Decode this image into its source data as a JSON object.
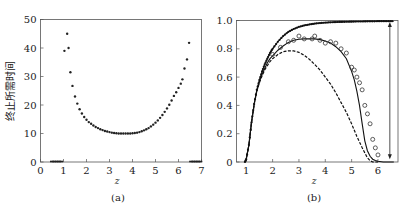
{
  "chart_data": [
    {
      "panel": "(a)",
      "type": "scatter",
      "title": "",
      "xlabel": "z",
      "ylabel": "终止所需时间",
      "xlim": [
        0,
        7
      ],
      "ylim": [
        0,
        50
      ],
      "xticks": [
        "0",
        "1",
        "2",
        "3",
        "4",
        "5",
        "6",
        "7"
      ],
      "yticks": [
        "0",
        "10",
        "20",
        "30",
        "40",
        "50"
      ],
      "grid": false,
      "legend": null,
      "series": [
        {
          "name": "termination time",
          "marker": "dot",
          "x": [
            0.5,
            0.6,
            0.7,
            0.8,
            0.9,
            1.04,
            1.16,
            1.22,
            1.3,
            1.39,
            1.5,
            1.6,
            1.7,
            1.8,
            1.9,
            2.0,
            2.1,
            2.2,
            2.3,
            2.4,
            2.5,
            2.6,
            2.7,
            2.8,
            2.9,
            3.0,
            3.1,
            3.2,
            3.3,
            3.4,
            3.5,
            3.6,
            3.7,
            3.8,
            3.9,
            4.0,
            4.1,
            4.2,
            4.3,
            4.4,
            4.5,
            4.6,
            4.7,
            4.8,
            4.9,
            5.0,
            5.1,
            5.2,
            5.3,
            5.4,
            5.5,
            5.6,
            5.7,
            5.8,
            5.9,
            6.0,
            6.1,
            6.17,
            6.26,
            6.37,
            6.46,
            6.55,
            6.65,
            6.75,
            6.85,
            6.95
          ],
          "y": [
            0,
            0,
            0,
            0,
            0,
            39,
            45,
            40,
            31.5,
            26.7,
            23,
            20.5,
            18.5,
            17,
            15.8,
            14.8,
            14,
            13.4,
            12.8,
            12.3,
            11.9,
            11.5,
            11.2,
            10.9,
            10.7,
            10.5,
            10.3,
            10.2,
            10.1,
            10.0,
            10.0,
            10.0,
            10.0,
            10.0,
            10.0,
            10.1,
            10.2,
            10.3,
            10.5,
            10.8,
            11.1,
            11.5,
            11.9,
            12.5,
            13.1,
            13.8,
            14.6,
            15.5,
            16.5,
            17.6,
            18.8,
            20.1,
            21.6,
            23.2,
            24.5,
            26,
            27.5,
            29,
            32.8,
            36,
            41.8,
            0,
            0,
            0,
            0,
            0
          ]
        }
      ]
    },
    {
      "panel": "(b)",
      "type": "line",
      "title": "",
      "xlabel": "z",
      "ylabel": "",
      "xlim": [
        0.63,
        6.76
      ],
      "ylim": [
        0,
        1.0
      ],
      "xticks": [
        "1",
        "2",
        "3",
        "4",
        "5",
        "6"
      ],
      "yticks": [
        "0",
        "0.2",
        "0.4",
        "0.6",
        "0.8",
        "1.0"
      ],
      "grid": false,
      "legend": null,
      "annotations": [
        {
          "type": "double-arrow",
          "x": 6.45,
          "y_from": 0.02,
          "y_to": 0.99
        }
      ],
      "series": [
        {
          "name": "upper curve (dotted markers)",
          "style": "solid-with-dots",
          "x": [
            0.95,
            1.0,
            1.1,
            1.2,
            1.3,
            1.4,
            1.5,
            1.6,
            1.7,
            1.8,
            1.9,
            2.0,
            2.2,
            2.4,
            2.6,
            2.8,
            3.0,
            3.2,
            3.4,
            3.6,
            3.8,
            4.0,
            4.2,
            4.4,
            4.6,
            4.8,
            5.0,
            5.2,
            5.4,
            5.6,
            5.8,
            6.0,
            6.2,
            6.4,
            6.6
          ],
          "y": [
            0.0,
            0.02,
            0.12,
            0.28,
            0.41,
            0.51,
            0.58,
            0.64,
            0.69,
            0.73,
            0.77,
            0.8,
            0.85,
            0.89,
            0.92,
            0.94,
            0.955,
            0.965,
            0.972,
            0.978,
            0.982,
            0.985,
            0.987,
            0.989,
            0.99,
            0.991,
            0.992,
            0.993,
            0.993,
            0.994,
            0.994,
            0.995,
            0.995,
            0.995,
            0.995
          ]
        },
        {
          "name": "middle solid curve",
          "style": "solid",
          "x": [
            0.95,
            1.0,
            1.1,
            1.2,
            1.3,
            1.4,
            1.5,
            1.6,
            1.7,
            1.8,
            1.9,
            2.0,
            2.2,
            2.4,
            2.6,
            2.8,
            3.0,
            3.2,
            3.4,
            3.6,
            3.8,
            4.0,
            4.2,
            4.4,
            4.6,
            4.8,
            5.0,
            5.1,
            5.2,
            5.3,
            5.4,
            5.5,
            5.6,
            5.7,
            5.8,
            5.9,
            6.0,
            6.2,
            6.4,
            6.6
          ],
          "y": [
            0.0,
            0.02,
            0.12,
            0.28,
            0.41,
            0.5,
            0.57,
            0.62,
            0.66,
            0.7,
            0.73,
            0.75,
            0.79,
            0.82,
            0.845,
            0.86,
            0.867,
            0.87,
            0.87,
            0.87,
            0.865,
            0.855,
            0.84,
            0.815,
            0.78,
            0.73,
            0.64,
            0.58,
            0.5,
            0.4,
            0.27,
            0.15,
            0.08,
            0.04,
            0.02,
            0.01,
            0.005,
            0.0,
            0.0,
            0.0
          ]
        },
        {
          "name": "open circles (simulation)",
          "style": "markers-circle",
          "x": [
            2.0,
            2.3,
            2.6,
            2.8,
            3.0,
            3.2,
            3.5,
            3.6,
            3.8,
            4.0,
            4.2,
            4.4,
            4.6,
            4.8,
            5.0,
            5.1,
            5.2,
            5.3,
            5.4,
            5.5,
            5.6,
            5.7,
            5.8,
            5.9,
            6.0
          ],
          "y": [
            0.76,
            0.81,
            0.85,
            0.86,
            0.89,
            0.87,
            0.87,
            0.89,
            0.86,
            0.84,
            0.85,
            0.84,
            0.8,
            0.77,
            0.67,
            0.65,
            0.6,
            0.56,
            0.51,
            0.4,
            0.34,
            0.27,
            0.16,
            0.1,
            0.05
          ]
        },
        {
          "name": "lower dashed curve",
          "style": "dashed",
          "x": [
            0.95,
            1.0,
            1.1,
            1.2,
            1.3,
            1.4,
            1.5,
            1.6,
            1.7,
            1.8,
            1.9,
            2.0,
            2.2,
            2.4,
            2.6,
            2.8,
            3.0,
            3.2,
            3.4,
            3.6,
            3.8,
            4.0,
            4.2,
            4.4,
            4.6,
            4.8,
            5.0,
            5.2,
            5.4,
            5.6,
            5.7,
            5.8,
            5.9,
            6.0
          ],
          "y": [
            0.0,
            0.02,
            0.12,
            0.28,
            0.41,
            0.5,
            0.56,
            0.61,
            0.65,
            0.68,
            0.71,
            0.73,
            0.76,
            0.78,
            0.785,
            0.785,
            0.775,
            0.755,
            0.725,
            0.69,
            0.65,
            0.6,
            0.55,
            0.49,
            0.42,
            0.35,
            0.27,
            0.18,
            0.1,
            0.03,
            0.01,
            0.0,
            0.0,
            0.0
          ]
        }
      ]
    }
  ],
  "captions": {
    "a": "(a)",
    "b": "(b)"
  }
}
